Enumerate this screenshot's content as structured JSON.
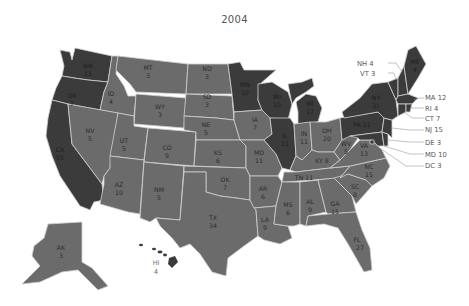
{
  "title": "2004",
  "colors": {
    "dem": "#3b3b3b",
    "rep": "#6b6b6b",
    "border": "#cfcfcf",
    "background": "#ffffff",
    "callout_text": "#5a5a5a"
  },
  "legend_note": "Dark = one party, medium gray = other party (no legend shown)",
  "states": {
    "WA": {
      "abbr": "WA",
      "votes": "11",
      "party": "dem"
    },
    "OR": {
      "abbr": "OR",
      "votes": "7",
      "party": "dem"
    },
    "CA": {
      "abbr": "CA",
      "votes": "55",
      "party": "dem"
    },
    "ID": {
      "abbr": "ID",
      "votes": "4",
      "party": "rep"
    },
    "NV": {
      "abbr": "NV",
      "votes": "5",
      "party": "rep"
    },
    "MT": {
      "abbr": "MT",
      "votes": "3",
      "party": "rep"
    },
    "WY": {
      "abbr": "WY",
      "votes": "3",
      "party": "rep"
    },
    "UT": {
      "abbr": "UT",
      "votes": "5",
      "party": "rep"
    },
    "AZ": {
      "abbr": "AZ",
      "votes": "10",
      "party": "rep"
    },
    "CO": {
      "abbr": "CO",
      "votes": "9",
      "party": "rep"
    },
    "NM": {
      "abbr": "NM",
      "votes": "5",
      "party": "rep"
    },
    "ND": {
      "abbr": "ND",
      "votes": "3",
      "party": "rep"
    },
    "SD": {
      "abbr": "SD",
      "votes": "3",
      "party": "rep"
    },
    "NE": {
      "abbr": "NE",
      "votes": "5",
      "party": "rep"
    },
    "KS": {
      "abbr": "KS",
      "votes": "6",
      "party": "rep"
    },
    "OK": {
      "abbr": "OK",
      "votes": "7",
      "party": "rep"
    },
    "TX": {
      "abbr": "TX",
      "votes": "34",
      "party": "rep"
    },
    "MN": {
      "abbr": "MN",
      "votes": "10",
      "party": "dem"
    },
    "IA": {
      "abbr": "IA",
      "votes": "7",
      "party": "rep"
    },
    "MO": {
      "abbr": "MO",
      "votes": "11",
      "party": "rep"
    },
    "AR": {
      "abbr": "AR",
      "votes": "6",
      "party": "rep"
    },
    "LA": {
      "abbr": "LA",
      "votes": "9",
      "party": "rep"
    },
    "WI": {
      "abbr": "WI",
      "votes": "10",
      "party": "dem"
    },
    "IL": {
      "abbr": "IL",
      "votes": "21",
      "party": "dem"
    },
    "MI": {
      "abbr": "MI",
      "votes": "17",
      "party": "dem"
    },
    "IN": {
      "abbr": "IN",
      "votes": "11",
      "party": "rep"
    },
    "OH": {
      "abbr": "OH",
      "votes": "20",
      "party": "rep"
    },
    "KY": {
      "abbr": "KY",
      "votes": "8",
      "party": "rep"
    },
    "TN": {
      "abbr": "TN",
      "votes": "11",
      "party": "rep"
    },
    "MS": {
      "abbr": "MS",
      "votes": "6",
      "party": "rep"
    },
    "AL": {
      "abbr": "AL",
      "votes": "9",
      "party": "rep"
    },
    "GA": {
      "abbr": "GA",
      "votes": "15",
      "party": "rep"
    },
    "FL": {
      "abbr": "FL",
      "votes": "27",
      "party": "rep"
    },
    "SC": {
      "abbr": "SC",
      "votes": "8",
      "party": "rep"
    },
    "NC": {
      "abbr": "NC",
      "votes": "15",
      "party": "rep"
    },
    "VA": {
      "abbr": "VA",
      "votes": "13",
      "party": "rep"
    },
    "WV": {
      "abbr": "WV",
      "votes": "5",
      "party": "rep"
    },
    "PA": {
      "abbr": "PA",
      "votes": "21",
      "party": "dem"
    },
    "NY": {
      "abbr": "NY",
      "votes": "31",
      "party": "dem"
    },
    "ME": {
      "abbr": "ME",
      "votes": "4",
      "party": "dem"
    },
    "AK": {
      "abbr": "AK",
      "votes": "3",
      "party": "rep"
    },
    "HI": {
      "abbr": "HI",
      "votes": "4",
      "party": "dem"
    }
  },
  "callouts": [
    {
      "id": "NH",
      "text": "NH 4"
    },
    {
      "id": "VT",
      "text": "VT 3"
    },
    {
      "id": "MA",
      "text": "MA 12"
    },
    {
      "id": "RI",
      "text": "RI 4"
    },
    {
      "id": "CT",
      "text": "CT 7"
    },
    {
      "id": "NJ",
      "text": "NJ 15"
    },
    {
      "id": "DE",
      "text": "DE 3"
    },
    {
      "id": "MD",
      "text": "MD 10"
    },
    {
      "id": "DC",
      "text": "DC 3"
    }
  ]
}
